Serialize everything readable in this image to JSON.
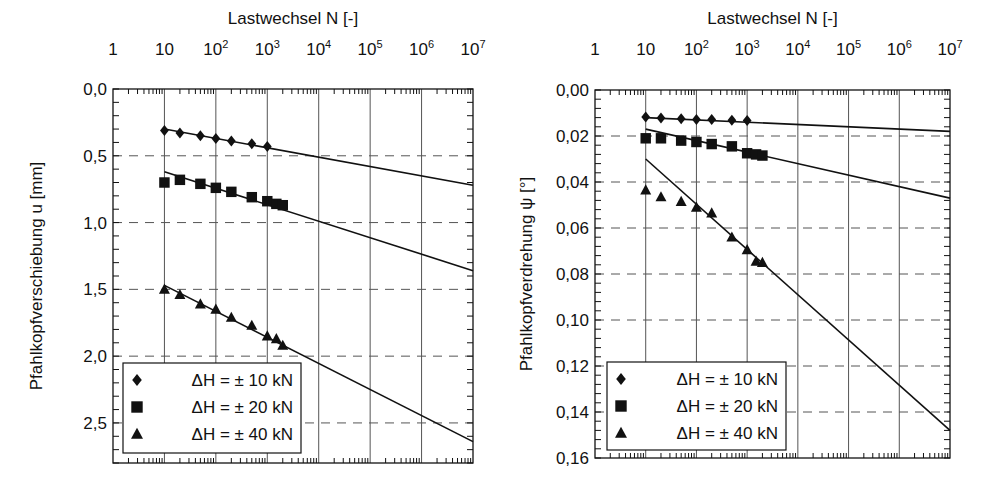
{
  "chart_data": [
    {
      "type": "scatter",
      "title": "",
      "xlabel": "Lastwechsel N [-]",
      "ylabel": "Pfahlkopfverschiebung u [mm]",
      "xscale": "log",
      "xlim": [
        1,
        10000000
      ],
      "ylim": [
        0.0,
        2.8
      ],
      "y_inverted": true,
      "x_ticks": [
        "1",
        "10",
        "10^2",
        "10^3",
        "10^4",
        "10^5",
        "10^6",
        "10^7"
      ],
      "y_ticks": [
        "0,0",
        "0,5",
        "1,0",
        "1,5",
        "2,0",
        "2,5"
      ],
      "y_tick_values": [
        0.0,
        0.5,
        1.0,
        1.5,
        2.0,
        2.5
      ],
      "grid": {
        "x": "solid-decades",
        "y": "dashed"
      },
      "legend_position": "lower-left",
      "series": [
        {
          "name": "ΔH = ± 10 kN",
          "marker": "diamond",
          "x": [
            10,
            20,
            50,
            100,
            200,
            500,
            1000
          ],
          "y": [
            0.31,
            0.33,
            0.35,
            0.37,
            0.39,
            0.41,
            0.43
          ],
          "fit": {
            "x": [
              10,
              10000000
            ],
            "y": [
              0.3,
              0.72
            ]
          }
        },
        {
          "name": "ΔH = ± 20 kN",
          "marker": "square",
          "x": [
            10,
            20,
            50,
            100,
            200,
            500,
            1000,
            1500,
            2000
          ],
          "y": [
            0.7,
            0.68,
            0.71,
            0.74,
            0.77,
            0.81,
            0.84,
            0.86,
            0.87
          ],
          "fit": {
            "x": [
              10,
              10000000
            ],
            "y": [
              0.62,
              1.36
            ]
          }
        },
        {
          "name": "ΔH = ± 40 kN",
          "marker": "triangle",
          "x": [
            10,
            20,
            50,
            100,
            200,
            500,
            1000,
            1500,
            2000
          ],
          "y": [
            1.5,
            1.54,
            1.61,
            1.65,
            1.71,
            1.77,
            1.85,
            1.87,
            1.92
          ],
          "fit": {
            "x": [
              10,
              10000000
            ],
            "y": [
              1.47,
              2.64
            ]
          }
        }
      ]
    },
    {
      "type": "scatter",
      "title": "",
      "xlabel": "Lastwechsel N [-]",
      "ylabel": "Pfahlkopfverdrehung ψ [°]",
      "xscale": "log",
      "xlim": [
        1,
        10000000
      ],
      "ylim": [
        0.0,
        0.16
      ],
      "y_inverted": true,
      "x_ticks": [
        "1",
        "10",
        "10^2",
        "10^3",
        "10^4",
        "10^5",
        "10^6",
        "10^7"
      ],
      "y_ticks": [
        "0,00",
        "0,02",
        "0,04",
        "0,06",
        "0,08",
        "0,10",
        "0,12",
        "0,14",
        "0,16"
      ],
      "y_tick_values": [
        0.0,
        0.02,
        0.04,
        0.06,
        0.08,
        0.1,
        0.12,
        0.14,
        0.16
      ],
      "grid": {
        "x": "solid-decades",
        "y": "dashed"
      },
      "legend_position": "lower-left",
      "series": [
        {
          "name": "ΔH = ± 10 kN",
          "marker": "diamond",
          "x": [
            10,
            20,
            50,
            100,
            200,
            500,
            1000
          ],
          "y": [
            0.0117,
            0.0122,
            0.0125,
            0.0128,
            0.0128,
            0.0132,
            0.0133
          ],
          "fit": {
            "x": [
              10,
              10000000
            ],
            "y": [
              0.012,
              0.018
            ]
          }
        },
        {
          "name": "ΔH = ± 20 kN",
          "marker": "square",
          "x": [
            10,
            20,
            50,
            100,
            200,
            500,
            1000,
            1500,
            2000
          ],
          "y": [
            0.021,
            0.021,
            0.022,
            0.0226,
            0.0235,
            0.0245,
            0.0275,
            0.028,
            0.0285
          ],
          "fit": {
            "x": [
              10,
              10000000
            ],
            "y": [
              0.017,
              0.047
            ]
          }
        },
        {
          "name": "ΔH = ± 40 kN",
          "marker": "triangle",
          "x": [
            10,
            20,
            50,
            100,
            200,
            500,
            1000,
            1500,
            2000
          ],
          "y": [
            0.0435,
            0.0465,
            0.0485,
            0.051,
            0.0535,
            0.064,
            0.0695,
            0.0745,
            0.075
          ],
          "fit": {
            "x": [
              10,
              10000000
            ],
            "y": [
              0.03,
              0.148
            ]
          }
        }
      ]
    }
  ],
  "panels": [
    {
      "frame": {
        "x0": 113,
        "x1": 473,
        "y0": 89,
        "y1": 463
      },
      "legend_box": {
        "x": 123,
        "y": 363,
        "w": 178,
        "h": 90
      },
      "ylabel_x": 42
    },
    {
      "frame": {
        "x0": 595,
        "x1": 950,
        "y0": 90,
        "y1": 458
      },
      "legend_box": {
        "x": 607,
        "y": 362,
        "w": 179,
        "h": 88
      },
      "ylabel_x": 532
    }
  ],
  "legend_labels": [
    "ΔH = ± 10 kN",
    "ΔH = ± 20 kN",
    "ΔH = ± 40 kN"
  ],
  "colors": {
    "ink": "#111111",
    "grid": "#555555",
    "background": "#ffffff"
  }
}
